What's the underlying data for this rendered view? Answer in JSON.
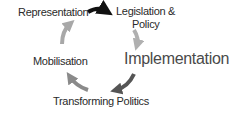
{
  "diagram": {
    "type": "cycle",
    "nodes": [
      {
        "id": "representation",
        "label": "Representation"
      },
      {
        "id": "legislation",
        "label_line1": "Legislation &",
        "label_line2": "Policy"
      },
      {
        "id": "implementation",
        "label": "Implementation"
      },
      {
        "id": "transforming",
        "label": "Transforming Politics"
      },
      {
        "id": "mobilisation",
        "label": "Mobilisation"
      }
    ],
    "edges": [
      {
        "from": "representation",
        "to": "legislation",
        "color": "#111111"
      },
      {
        "from": "legislation",
        "to": "implementation",
        "color": "#b0b0b0"
      },
      {
        "from": "implementation",
        "to": "transforming",
        "color": "#555555"
      },
      {
        "from": "transforming",
        "to": "mobilisation",
        "color": "#8a8a8a"
      },
      {
        "from": "mobilisation",
        "to": "representation",
        "color": "#a8a8a8"
      }
    ]
  }
}
